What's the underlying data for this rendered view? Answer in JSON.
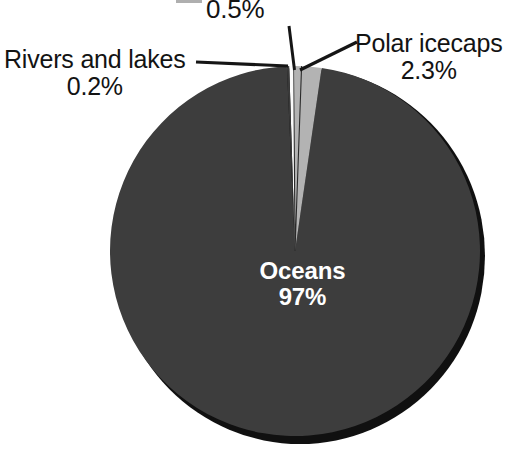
{
  "chart_data": {
    "type": "pie",
    "title": "",
    "subtitle": "",
    "xlabel": "",
    "ylabel": "",
    "legend_position": "none",
    "grid": false,
    "units": "%",
    "total": 100,
    "categories": [
      "Oceans",
      "Polar icecaps",
      "",
      "Rivers and lakes"
    ],
    "values": [
      97,
      2.3,
      0.5,
      0.2
    ],
    "labels": [
      "97%",
      "2.3%",
      "0.5%",
      "0.2%"
    ],
    "slices": [
      {
        "name": "Oceans",
        "value": 97,
        "value_label": "97%",
        "color": "#3d3d3d",
        "label_placement": "inside",
        "label_color": "#ffffff"
      },
      {
        "name": "Polar icecaps",
        "value": 2.3,
        "value_label": "2.3%",
        "color": "#b3b3b3",
        "label_placement": "outside-right",
        "label_color": "#131313"
      },
      {
        "name": "",
        "value": 0.5,
        "value_label": "0.5%",
        "color": "#fbfbfb",
        "label_placement": "outside-top",
        "label_color": "#131313"
      },
      {
        "name": "Rivers and lakes",
        "value": 0.2,
        "value_label": "0.2%",
        "color": "#3a3a3a",
        "label_placement": "outside-left",
        "label_color": "#131313"
      }
    ]
  },
  "labels": {
    "polar": {
      "name": "Polar icecaps",
      "value": "2.3%"
    },
    "rivers": {
      "name": "Rivers and lakes",
      "value": "0.2%"
    },
    "half_percent": {
      "value": "0.5%"
    },
    "oceans": {
      "name": "Oceans",
      "value": "97%"
    }
  },
  "colors": {
    "oceans_slice": "#3d3d3d",
    "icecap_slice": "#b3b3b3",
    "rivers_slice": "#3a3a3a",
    "gap_slice": "#fbfbfb",
    "shadow": "#101010",
    "leader_line": "#151515",
    "label_text": "#131313",
    "inside_label_text": "#ffffff",
    "background": "#ffffff"
  },
  "geometry": {
    "center_x": 295,
    "center_y": 251,
    "radius": 185
  }
}
